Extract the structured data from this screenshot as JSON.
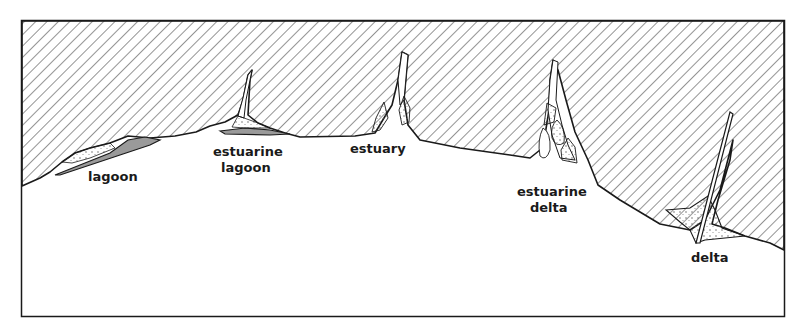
{
  "diagram": {
    "type": "coastal-landform-schematic",
    "colors": {
      "land_hatch": "#3a3a3a",
      "outline": "#1a1a1a",
      "sediment": "#9a9a9a",
      "background": "#ffffff"
    },
    "labels": {
      "lagoon": "lagoon",
      "estuarine_lagoon_1": "estuarine",
      "estuarine_lagoon_2": "lagoon",
      "estuary": "estuary",
      "estuarine_delta_1": "estuarine",
      "estuarine_delta_2": "delta",
      "delta": "delta"
    },
    "features": [
      {
        "name": "lagoon",
        "order": 1
      },
      {
        "name": "estuarine lagoon",
        "order": 2
      },
      {
        "name": "estuary",
        "order": 3
      },
      {
        "name": "estuarine delta",
        "order": 4
      },
      {
        "name": "delta",
        "order": 5
      }
    ]
  }
}
